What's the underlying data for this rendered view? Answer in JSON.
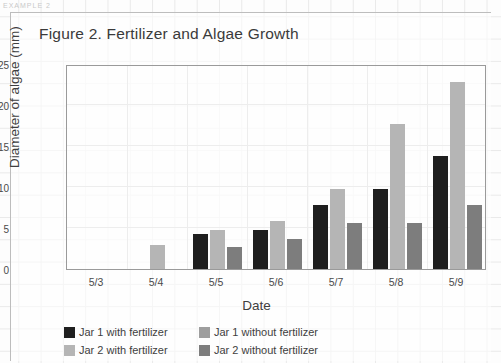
{
  "page": {
    "top_strip_text": "EXAMPLE 2"
  },
  "chart_card": {
    "title": "Figure 2. Fertilizer and Algae Growth"
  },
  "axes": {
    "ylabel": "Diameter of algae (mm)",
    "xlabel": "Date",
    "yticks": [
      "0",
      "5",
      "10",
      "15",
      "20",
      "25"
    ],
    "xticks": [
      "5/3",
      "5/4",
      "5/5",
      "5/6",
      "5/7",
      "5/8",
      "5/9"
    ]
  },
  "legend": {
    "items": [
      {
        "label": "Jar 1 with fertilizer",
        "color": "#1f1f1f"
      },
      {
        "label": "Jar 1 without fertilizer",
        "color": "#9e9e9e"
      },
      {
        "label": "Jar 2 with fertilizer",
        "color": "#b5b5b5"
      },
      {
        "label": "Jar 2 without fertilizer",
        "color": "#7d7d7d"
      }
    ]
  },
  "chart_data": {
    "type": "bar",
    "title": "Figure 2. Fertilizer and Algae Growth",
    "xlabel": "Date",
    "ylabel": "Diameter of algae (mm)",
    "ylim": [
      0,
      25
    ],
    "yticks": [
      0,
      5,
      10,
      15,
      20,
      25
    ],
    "grid": true,
    "legend_position": "bottom",
    "categories": [
      "5/3",
      "5/4",
      "5/5",
      "5/6",
      "5/7",
      "5/8",
      "5/9"
    ],
    "series": [
      {
        "name": "Jar 1 with fertilizer",
        "color": "#1f1f1f",
        "values": [
          0,
          0,
          4.3,
          4.8,
          7.8,
          9.8,
          13.8
        ]
      },
      {
        "name": "Jar 2 with fertilizer",
        "color": "#b5b5b5",
        "values": [
          0,
          2.9,
          4.7,
          5.8,
          9.8,
          17.7,
          22.8
        ]
      },
      {
        "name": "Jar 2 without fertilizer",
        "color": "#7d7d7d",
        "values": [
          0,
          0,
          2.7,
          3.6,
          5.6,
          5.6,
          7.8
        ]
      }
    ]
  }
}
